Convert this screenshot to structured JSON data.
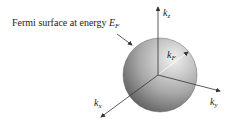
{
  "diagram": {
    "caption": "Fermi surface at energy",
    "caption_symbol": "E",
    "caption_symbol_sub": "F",
    "axes": [
      {
        "name": "k",
        "sub": "z"
      },
      {
        "name": "k",
        "sub": "y"
      },
      {
        "name": "k",
        "sub": "x"
      }
    ],
    "radius_label": {
      "name": "k",
      "sub": "F"
    },
    "colors": {
      "sphere_light": "#e6e6e6",
      "sphere_dark": "#5a5a5a",
      "line": "#333333"
    }
  }
}
